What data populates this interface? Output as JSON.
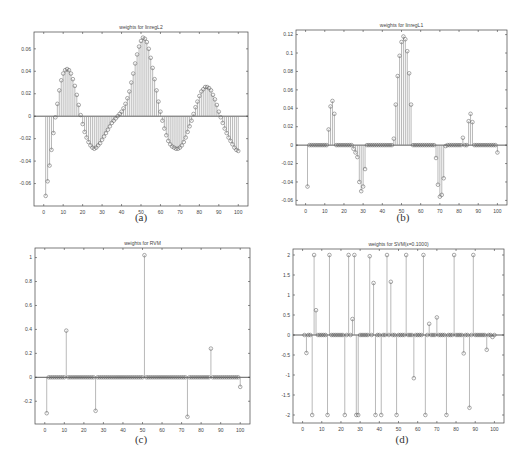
{
  "chart_data": [
    {
      "id": "a",
      "type": "stem",
      "title": "weights for linregL2",
      "caption": "(a)",
      "xlabel": "",
      "ylabel": "",
      "xlim": [
        -5,
        105
      ],
      "ylim": [
        -0.08,
        0.075
      ],
      "xticks": [
        0,
        10,
        20,
        30,
        40,
        50,
        60,
        70,
        80,
        90,
        100
      ],
      "yticks": [
        -0.06,
        -0.04,
        -0.02,
        0,
        0.02,
        0.04,
        0.06
      ],
      "ytick_labels": [
        "-0.06",
        "-0.04",
        "-0.02",
        "0",
        "0.02",
        "0.04",
        "0.06"
      ],
      "grid": false,
      "x": [
        1,
        2,
        3,
        4,
        5,
        6,
        7,
        8,
        9,
        10,
        11,
        12,
        13,
        14,
        15,
        16,
        17,
        18,
        19,
        20,
        21,
        22,
        23,
        24,
        25,
        26,
        27,
        28,
        29,
        30,
        31,
        32,
        33,
        34,
        35,
        36,
        37,
        38,
        39,
        40,
        41,
        42,
        43,
        44,
        45,
        46,
        47,
        48,
        49,
        50,
        51,
        52,
        53,
        54,
        55,
        56,
        57,
        58,
        59,
        60,
        61,
        62,
        63,
        64,
        65,
        66,
        67,
        68,
        69,
        70,
        71,
        72,
        73,
        74,
        75,
        76,
        77,
        78,
        79,
        80,
        81,
        82,
        83,
        84,
        85,
        86,
        87,
        88,
        89,
        90,
        91,
        92,
        93,
        94,
        95,
        96,
        97,
        98,
        99,
        100
      ],
      "values": [
        -0.071,
        -0.058,
        -0.044,
        -0.03,
        -0.015,
        -0.001,
        0.011,
        0.023,
        0.032,
        0.038,
        0.041,
        0.042,
        0.041,
        0.038,
        0.033,
        0.027,
        0.019,
        0.01,
        0.001,
        -0.007,
        -0.014,
        -0.019,
        -0.023,
        -0.026,
        -0.028,
        -0.029,
        -0.028,
        -0.026,
        -0.024,
        -0.021,
        -0.018,
        -0.015,
        -0.012,
        -0.009,
        -0.006,
        -0.004,
        -0.002,
        0.0,
        0.002,
        0.004,
        0.007,
        0.011,
        0.016,
        0.022,
        0.03,
        0.038,
        0.047,
        0.055,
        0.062,
        0.067,
        0.07,
        0.069,
        0.066,
        0.06,
        0.052,
        0.043,
        0.033,
        0.023,
        0.013,
        0.004,
        -0.004,
        -0.011,
        -0.017,
        -0.022,
        -0.025,
        -0.027,
        -0.028,
        -0.029,
        -0.029,
        -0.028,
        -0.026,
        -0.023,
        -0.019,
        -0.014,
        -0.009,
        -0.004,
        0.002,
        0.008,
        0.013,
        0.018,
        0.022,
        0.024,
        0.026,
        0.026,
        0.025,
        0.023,
        0.019,
        0.015,
        0.01,
        0.004,
        -0.001,
        -0.006,
        -0.011,
        -0.015,
        -0.019,
        -0.022,
        -0.025,
        -0.028,
        -0.03,
        -0.031
      ]
    },
    {
      "id": "b",
      "type": "stem",
      "title": "weights for linregL1",
      "caption": "(b)",
      "xlabel": "",
      "ylabel": "",
      "xlim": [
        -5,
        105
      ],
      "ylim": [
        -0.065,
        0.125
      ],
      "xticks": [
        0,
        10,
        20,
        30,
        40,
        50,
        60,
        70,
        80,
        90,
        100
      ],
      "yticks": [
        -0.06,
        -0.04,
        -0.02,
        0,
        0.02,
        0.04,
        0.06,
        0.08,
        0.1,
        0.12
      ],
      "ytick_labels": [
        "-0.06",
        "-0.04",
        "-0.02",
        "0",
        "0.02",
        "0.04",
        "0.06",
        "0.08",
        "0.1",
        "0.12"
      ],
      "grid": false,
      "x": [
        1,
        2,
        3,
        4,
        5,
        6,
        7,
        8,
        9,
        10,
        11,
        12,
        13,
        14,
        15,
        16,
        17,
        18,
        19,
        20,
        21,
        22,
        23,
        24,
        25,
        26,
        27,
        28,
        29,
        30,
        31,
        32,
        33,
        34,
        35,
        36,
        37,
        38,
        39,
        40,
        41,
        42,
        43,
        44,
        45,
        46,
        47,
        48,
        49,
        50,
        51,
        52,
        53,
        54,
        55,
        56,
        57,
        58,
        59,
        60,
        61,
        62,
        63,
        64,
        65,
        66,
        67,
        68,
        69,
        70,
        71,
        72,
        73,
        74,
        75,
        76,
        77,
        78,
        79,
        80,
        81,
        82,
        83,
        84,
        85,
        86,
        87,
        88,
        89,
        90,
        91,
        92,
        93,
        94,
        95,
        96,
        97,
        98,
        99,
        100
      ],
      "values": [
        -0.045,
        0,
        0,
        0,
        0,
        0,
        0,
        0,
        0,
        0,
        0,
        0.017,
        0.042,
        0.048,
        0.034,
        0,
        0,
        0,
        0,
        0,
        0,
        0,
        0,
        0,
        -0.004,
        -0.008,
        -0.013,
        -0.04,
        -0.05,
        -0.045,
        -0.026,
        0,
        0,
        0,
        0,
        0,
        0,
        0,
        0,
        0,
        0,
        0,
        0,
        0,
        0,
        0.007,
        0.044,
        0.075,
        0.097,
        0.112,
        0.118,
        0.115,
        0.102,
        0.078,
        0.044,
        0,
        0,
        0,
        0,
        0,
        0,
        0,
        0,
        0,
        0,
        0,
        0,
        -0.014,
        -0.043,
        -0.056,
        -0.054,
        -0.036,
        -0.001,
        0,
        0,
        0,
        0,
        0,
        0,
        0,
        0,
        0.008,
        0,
        0,
        0.026,
        0.034,
        0.025,
        0,
        0,
        0,
        0,
        0,
        0,
        0,
        0,
        0,
        0,
        0,
        0,
        -0.008
      ]
    },
    {
      "id": "c",
      "type": "stem",
      "title": "weights for RVM",
      "caption": "(c)",
      "xlabel": "",
      "ylabel": "",
      "xlim": [
        -5,
        105
      ],
      "ylim": [
        -0.39,
        1.08
      ],
      "xticks": [
        0,
        10,
        20,
        30,
        40,
        50,
        60,
        70,
        80,
        90,
        100
      ],
      "yticks": [
        -0.2,
        0,
        0.2,
        0.4,
        0.6,
        0.8,
        1
      ],
      "ytick_labels": [
        "-0.2",
        "0",
        "0.2",
        "0.4",
        "0.6",
        "0.8",
        "1"
      ],
      "grid": false,
      "x": [
        1,
        2,
        3,
        4,
        5,
        6,
        7,
        8,
        9,
        10,
        11,
        12,
        13,
        14,
        15,
        16,
        17,
        18,
        19,
        20,
        21,
        22,
        23,
        24,
        25,
        26,
        27,
        28,
        29,
        30,
        31,
        32,
        33,
        34,
        35,
        36,
        37,
        38,
        39,
        40,
        41,
        42,
        43,
        44,
        45,
        46,
        47,
        48,
        49,
        50,
        51,
        52,
        53,
        54,
        55,
        56,
        57,
        58,
        59,
        60,
        61,
        62,
        63,
        64,
        65,
        66,
        67,
        68,
        69,
        70,
        71,
        72,
        73,
        74,
        75,
        76,
        77,
        78,
        79,
        80,
        81,
        82,
        83,
        84,
        85,
        86,
        87,
        88,
        89,
        90,
        91,
        92,
        93,
        94,
        95,
        96,
        97,
        98,
        99,
        100
      ],
      "values": [
        -0.3,
        0,
        0,
        0,
        0,
        0,
        0,
        0,
        0,
        0,
        0.39,
        0,
        0,
        0,
        0,
        0,
        0,
        0,
        0,
        0,
        0,
        0,
        0,
        0,
        0,
        -0.28,
        0,
        0,
        0,
        0,
        0,
        0,
        0,
        0,
        0,
        0,
        0,
        0,
        0,
        0,
        0,
        0,
        0,
        0,
        0,
        0,
        0,
        0,
        0,
        0,
        1.02,
        0,
        0,
        0,
        0,
        0,
        0,
        0,
        0,
        0,
        0,
        0,
        0,
        0,
        0,
        0,
        0,
        0,
        0,
        0,
        0,
        0,
        -0.33,
        0,
        0,
        0,
        0,
        0,
        0,
        0,
        0,
        0,
        0,
        0,
        0.24,
        0,
        0,
        0,
        0,
        0,
        0,
        0,
        0,
        0,
        0,
        0,
        0,
        0,
        0,
        -0.08
      ]
    },
    {
      "id": "d",
      "type": "stem",
      "title": "weights for SVM(ε=0.1000)",
      "caption": "(d)",
      "xlabel": "",
      "ylabel": "",
      "xlim": [
        -5,
        105
      ],
      "ylim": [
        -2.2,
        2.15
      ],
      "xticks": [
        0,
        10,
        20,
        30,
        40,
        50,
        60,
        70,
        80,
        90,
        100
      ],
      "yticks": [
        -2,
        -1.5,
        -1,
        -0.5,
        0,
        0.5,
        1,
        1.5,
        2
      ],
      "ytick_labels": [
        "-2",
        "-1.5",
        "-1",
        "-0.5",
        "0",
        "0.5",
        "1",
        "1.5",
        "2"
      ],
      "grid": false,
      "x": [
        1,
        2,
        3,
        4,
        5,
        6,
        7,
        8,
        9,
        10,
        11,
        12,
        13,
        14,
        15,
        16,
        17,
        18,
        19,
        20,
        21,
        22,
        23,
        24,
        25,
        26,
        27,
        28,
        29,
        30,
        31,
        32,
        33,
        34,
        35,
        36,
        37,
        38,
        39,
        40,
        41,
        42,
        43,
        44,
        45,
        46,
        47,
        48,
        49,
        50,
        51,
        52,
        53,
        54,
        55,
        56,
        57,
        58,
        59,
        60,
        61,
        62,
        63,
        64,
        65,
        66,
        67,
        68,
        69,
        70,
        71,
        72,
        73,
        74,
        75,
        76,
        77,
        78,
        79,
        80,
        81,
        82,
        83,
        84,
        85,
        86,
        87,
        88,
        89,
        90,
        91,
        92,
        93,
        94,
        95,
        96,
        97,
        98,
        99,
        100
      ],
      "values": [
        0,
        -0.45,
        0,
        0,
        -2,
        2,
        0.62,
        0,
        0,
        0,
        0,
        0,
        -2,
        2,
        0,
        0,
        0,
        0,
        0,
        0,
        0,
        -2,
        0,
        2,
        0,
        0.4,
        2,
        -2,
        -2,
        0,
        0,
        0,
        0,
        0,
        1.97,
        0,
        1.3,
        -2,
        0,
        0,
        -2,
        0,
        0,
        2,
        0,
        1.33,
        0,
        0,
        -2,
        0,
        0,
        0,
        0,
        2,
        0,
        0,
        0,
        -1.08,
        0,
        0,
        0,
        0,
        2,
        -2,
        0,
        0.28,
        0,
        0,
        0,
        0.44,
        0,
        0,
        0,
        0,
        -2,
        0,
        0,
        0,
        2,
        0,
        0,
        0,
        0,
        -0.46,
        0,
        0,
        -1.82,
        0,
        2,
        0,
        0,
        0,
        0,
        0,
        0,
        -0.37,
        0,
        0,
        -0.05,
        0
      ]
    }
  ],
  "panels": {
    "a": {
      "title": "weights for linregL2",
      "caption": "(a)"
    },
    "b": {
      "title": "weights for linregL1",
      "caption": "(b)"
    },
    "c": {
      "title": "weights for RVM",
      "caption": "(c)"
    },
    "d": {
      "title": "weights for SVM(ε=0.1000)",
      "caption": "(d)"
    }
  },
  "colors": {
    "stem": "#8a8a8a",
    "marker": "#555555",
    "axis": "#444444",
    "baseline": "#333333"
  }
}
